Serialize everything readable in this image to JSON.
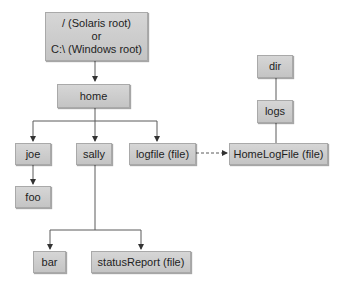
{
  "nodes": {
    "root": {
      "line1": "/ (Solaris root)",
      "line2": "or",
      "line3": "C:\\ (Windows root)"
    },
    "home": {
      "label": "home"
    },
    "joe": {
      "label": "joe"
    },
    "sally": {
      "label": "sally"
    },
    "logfile": {
      "label": "logfile (file)"
    },
    "foo": {
      "label": "foo"
    },
    "bar": {
      "label": "bar"
    },
    "statusReport": {
      "label": "statusReport (file)"
    },
    "dir": {
      "label": "dir"
    },
    "logs": {
      "label": "logs"
    },
    "homeLogFile": {
      "label": "HomeLogFile (file)"
    }
  },
  "edges": [
    {
      "from": "root",
      "to": "home",
      "style": "solid"
    },
    {
      "from": "home",
      "to": "joe",
      "style": "solid"
    },
    {
      "from": "home",
      "to": "sally",
      "style": "solid"
    },
    {
      "from": "home",
      "to": "logfile",
      "style": "solid"
    },
    {
      "from": "joe",
      "to": "foo",
      "style": "solid"
    },
    {
      "from": "sally",
      "to": "bar",
      "style": "solid"
    },
    {
      "from": "sally",
      "to": "statusReport",
      "style": "solid"
    },
    {
      "from": "dir",
      "to": "logs",
      "style": "solid"
    },
    {
      "from": "logs",
      "to": "homeLogFile",
      "style": "solid"
    },
    {
      "from": "logfile",
      "to": "homeLogFile",
      "style": "dashed"
    }
  ],
  "colors": {
    "node_fill": "#cdcdcd",
    "node_border": "#a9a9a9",
    "edge": "#5a5a5a",
    "text": "#1e1e1e"
  }
}
